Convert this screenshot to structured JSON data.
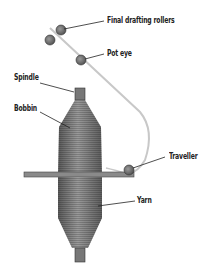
{
  "diagram": {
    "labels": {
      "final_drafting_rollers": "Final drafting rollers",
      "pot_eye": "Pot eye",
      "spindle": "Spindle",
      "bobbin": "Bobbin",
      "traveller": "Traveller",
      "yarn": "Yarn"
    },
    "colors": {
      "yarn_body": "#7a7a7a",
      "yarn_line": "#c8c8c8",
      "ring": "#8a8a8a",
      "roller": "#666666"
    }
  }
}
